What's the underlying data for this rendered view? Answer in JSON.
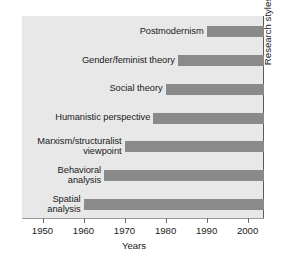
{
  "chart_data": {
    "type": "bar",
    "orientation": "horizontal",
    "title": "",
    "xlabel": "Years",
    "ylabel": "Research styles",
    "xlim": [
      1945,
      2004
    ],
    "grid": false,
    "legend": null,
    "xticks": [
      1950,
      1960,
      1970,
      1980,
      1990,
      2000
    ],
    "xtick_labels": [
      "1950",
      "1960",
      "1970",
      "1980",
      "1990",
      "2000"
    ],
    "categories": [
      "Postmodernism",
      "Gender/feminist theory",
      "Social theory",
      "Humanistic perspective",
      "Marxism/structuralist viewpoint",
      "Behavioral analysis",
      "Spatial analysis"
    ],
    "category_label_lines": [
      [
        "Postmodernism"
      ],
      [
        "Gender/feminist theory"
      ],
      [
        "Social theory"
      ],
      [
        "Humanistic perspective"
      ],
      [
        "Marxism/structuralist",
        "viewpoint"
      ],
      [
        "Behavioral",
        "analysis"
      ],
      [
        "Spatial",
        "analysis"
      ]
    ],
    "bars": [
      {
        "label": "Postmodernism",
        "start": 1990,
        "end": 2004
      },
      {
        "label": "Gender/feminist theory",
        "start": 1983,
        "end": 2004
      },
      {
        "label": "Social theory",
        "start": 1980,
        "end": 2004
      },
      {
        "label": "Humanistic perspective",
        "start": 1977,
        "end": 2004
      },
      {
        "label": "Marxism/structuralist viewpoint",
        "start": 1970,
        "end": 2004
      },
      {
        "label": "Behavioral analysis",
        "start": 1965,
        "end": 2004
      },
      {
        "label": "Spatial analysis",
        "start": 1960,
        "end": 2004
      }
    ],
    "colors": {
      "bar": "#8a8a8a",
      "panel_background": "#e8e8e8",
      "axis": "#5a5a5a",
      "text": "#1a1a1a"
    }
  }
}
